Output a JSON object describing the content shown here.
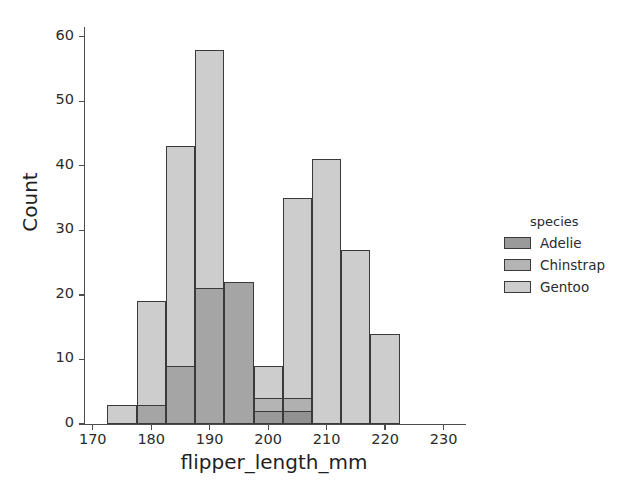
{
  "chart_data": {
    "type": "bar",
    "chart_subtype": "histogram-overlapping",
    "title": "",
    "xlabel": "flipper_length_mm",
    "ylabel": "Count",
    "xlim": [
      168.5,
      233.5
    ],
    "ylim": [
      0,
      61.5
    ],
    "xticks": [
      170,
      180,
      190,
      200,
      210,
      220,
      230
    ],
    "yticks": [
      0,
      10,
      20,
      30,
      40,
      50,
      60
    ],
    "grid": false,
    "bin_width": 5,
    "bin_edges": [
      172.5,
      177.5,
      182.5,
      187.5,
      192.5,
      197.5,
      202.5,
      207.5,
      212.5,
      217.5,
      222.5,
      227.5,
      232.5
    ],
    "legend": {
      "title": "species",
      "position": "right",
      "entries": [
        "Adelie",
        "Chinstrap",
        "Gentoo"
      ]
    },
    "series": [
      {
        "name": "Adelie",
        "color": "#9a9a9a",
        "bin_starts": [
          172.5,
          177.5,
          182.5,
          187.5,
          192.5,
          197.5,
          202.5,
          207.5
        ],
        "values": [
          0,
          3,
          9,
          21,
          22,
          4,
          2,
          0
        ]
      },
      {
        "name": "Chinstrap",
        "color": "#b4b4b4",
        "bin_starts": [
          182.5,
          187.5,
          192.5,
          197.5,
          202.5,
          207.5,
          212.5
        ],
        "values": [
          0,
          0,
          0,
          0,
          4,
          4,
          0
        ]
      },
      {
        "name": "Gentoo",
        "color": "#cdcdcd",
        "bin_starts": [
          172.5,
          177.5,
          182.5,
          187.5,
          192.5,
          197.5,
          202.5,
          207.5,
          212.5,
          217.5,
          222.5,
          227.5
        ],
        "values": [
          3,
          19,
          43,
          58,
          0,
          0,
          9,
          35,
          41,
          27,
          14,
          0
        ]
      }
    ],
    "bars": [
      {
        "label": "bin-172.5-177.5-back",
        "x0": 172.5,
        "x1": 177.5,
        "y": 3,
        "fill": "#cdcdcd"
      },
      {
        "label": "bin-177.5-182.5-back",
        "x0": 177.5,
        "x1": 182.5,
        "y": 19,
        "fill": "#cdcdcd"
      },
      {
        "label": "bin-177.5-182.5-front",
        "x0": 177.5,
        "x1": 182.5,
        "y": 3,
        "fill": "#a5a5a5"
      },
      {
        "label": "bin-182.5-187.5-back",
        "x0": 182.5,
        "x1": 187.5,
        "y": 43,
        "fill": "#cdcdcd"
      },
      {
        "label": "bin-182.5-187.5-front",
        "x0": 182.5,
        "x1": 187.5,
        "y": 9,
        "fill": "#a5a5a5"
      },
      {
        "label": "bin-187.5-192.5-back",
        "x0": 187.5,
        "x1": 192.5,
        "y": 58,
        "fill": "#cdcdcd"
      },
      {
        "label": "bin-187.5-192.5-front",
        "x0": 187.5,
        "x1": 192.5,
        "y": 21,
        "fill": "#a5a5a5"
      },
      {
        "label": "bin-192.5-197.5-front",
        "x0": 192.5,
        "x1": 197.5,
        "y": 22,
        "fill": "#a5a5a5"
      },
      {
        "label": "bin-197.5-202.5-back",
        "x0": 197.5,
        "x1": 202.5,
        "y": 9,
        "fill": "#cdcdcd"
      },
      {
        "label": "bin-197.5-202.5-mid",
        "x0": 197.5,
        "x1": 202.5,
        "y": 4,
        "fill": "#b4b4b4"
      },
      {
        "label": "bin-197.5-202.5-front",
        "x0": 197.5,
        "x1": 202.5,
        "y": 2,
        "fill": "#9a9a9a"
      },
      {
        "label": "bin-202.5-207.5-back",
        "x0": 202.5,
        "x1": 207.5,
        "y": 35,
        "fill": "#cdcdcd"
      },
      {
        "label": "bin-202.5-207.5-mid",
        "x0": 202.5,
        "x1": 207.5,
        "y": 4,
        "fill": "#b0b0b0"
      },
      {
        "label": "bin-202.5-207.5-front",
        "x0": 202.5,
        "x1": 207.5,
        "y": 2,
        "fill": "#919191"
      },
      {
        "label": "bin-207.5-212.5-back",
        "x0": 207.5,
        "x1": 212.5,
        "y": 41,
        "fill": "#cdcdcd"
      },
      {
        "label": "bin-212.5-217.5-back",
        "x0": 212.5,
        "x1": 217.5,
        "y": 27,
        "fill": "#cdcdcd"
      },
      {
        "label": "bin-217.5-222.5-back",
        "x0": 217.5,
        "x1": 222.5,
        "y": 14,
        "fill": "#cdcdcd"
      }
    ]
  },
  "axis": {
    "x_tick_labels": [
      "170",
      "180",
      "190",
      "200",
      "210",
      "220",
      "230"
    ],
    "y_tick_labels": [
      "0",
      "10",
      "20",
      "30",
      "40",
      "50",
      "60"
    ],
    "xlabel": "flipper_length_mm",
    "ylabel": "Count"
  },
  "legend": {
    "title": "species",
    "items": [
      {
        "label": "Adelie",
        "swatch": "#9a9a9a"
      },
      {
        "label": "Chinstrap",
        "swatch": "#b4b4b4"
      },
      {
        "label": "Gentoo",
        "swatch": "#cdcdcd"
      }
    ]
  },
  "style": {
    "background": "#ffffff",
    "spine_color": "#4d4d4d",
    "bar_edge_color": "#3a3a3a",
    "text_color": "#2b2b2b"
  }
}
